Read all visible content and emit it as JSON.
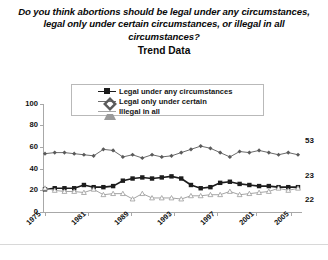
{
  "chart_data": {
    "type": "line",
    "title": "Do you think abortions should be legal under any circumstances, legal only under certain circumstances, or illegal in all circumstances?",
    "subtitle": "Trend Data",
    "xlabel": "",
    "ylabel": "",
    "ylim": [
      0,
      100
    ],
    "yticks": [
      0,
      20,
      40,
      60,
      80,
      100
    ],
    "xticks": [
      "1975",
      "1981",
      "1989",
      "1993",
      "1997",
      "2001",
      "2005"
    ],
    "grid": false,
    "legend_position": "top",
    "x": [
      1975,
      1976,
      1977,
      1979,
      1980,
      1981,
      1983,
      1988,
      1989,
      1990,
      1991,
      1992,
      1993,
      1994,
      1995,
      1996,
      1997,
      1998,
      1999,
      2000,
      2001,
      2002,
      2003,
      2004,
      2005,
      2006,
      2007
    ],
    "series": [
      {
        "name": "Legal under any circumstances",
        "marker": "square",
        "color": "#1c1c1c",
        "values": [
          21,
          22,
          22,
          22,
          25,
          23,
          23,
          24,
          29,
          31,
          32,
          31,
          32,
          33,
          31,
          25,
          22,
          23,
          27,
          28,
          26,
          25,
          24,
          24,
          23,
          23,
          23
        ],
        "end_label": "23"
      },
      {
        "name": "Legal only under certain",
        "marker": "diamond",
        "color": "#5a5a5a",
        "values": [
          54,
          55,
          55,
          54,
          53,
          52,
          58,
          57,
          51,
          53,
          50,
          53,
          51,
          52,
          55,
          58,
          61,
          59,
          55,
          51,
          56,
          55,
          57,
          55,
          53,
          55,
          53
        ],
        "end_label": "53"
      },
      {
        "name": "Illegal in all",
        "marker": "triangle",
        "color": "#9a9a9a",
        "values": [
          22,
          20,
          19,
          19,
          18,
          21,
          16,
          17,
          17,
          12,
          17,
          13,
          13,
          13,
          12,
          15,
          15,
          16,
          16,
          19,
          16,
          17,
          18,
          19,
          22,
          20,
          22
        ],
        "end_label": "22"
      }
    ]
  },
  "legend": {
    "items": [
      {
        "label": "Legal under any circumstances"
      },
      {
        "label": "Legal only under certain"
      },
      {
        "label": "Illegal in all"
      }
    ]
  },
  "axes": {
    "y_labels": [
      "100",
      "80",
      "60",
      "40",
      "20",
      "0"
    ],
    "x_labels": [
      "1975",
      "1981",
      "1989",
      "1993",
      "1997",
      "2001",
      "2005"
    ]
  },
  "end_labels": [
    "53",
    "23",
    "22"
  ]
}
